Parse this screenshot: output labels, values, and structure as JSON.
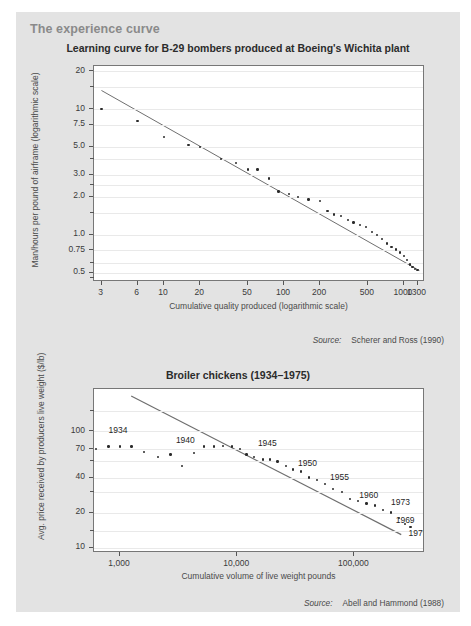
{
  "panel": {
    "title": "The experience curve",
    "background": "#e3e3e3",
    "title_color": "#8a8a8a"
  },
  "charts": [
    {
      "id": "learning-curve-b29",
      "title": "Learning curve for B-29 bombers produced at Boeing's Wichita plant",
      "xlabel": "Cumulative quality produced (logarithmic scale)",
      "ylabel": "Man/hours per pound of airframe (logarithmic scale)",
      "source_word": "Source:",
      "source_text": "Scherer and Ross (1990)",
      "ytick_labels": [
        "20",
        "10",
        "7.5",
        "5.0",
        "3.0",
        "2.0",
        "1.0",
        "0.75",
        "0.5"
      ],
      "xtick_labels": [
        "3",
        "6",
        "10",
        "20",
        "50",
        "100",
        "200",
        "500",
        "1000",
        "1300"
      ]
    },
    {
      "id": "broiler-chickens",
      "title": "Broiler chickens (1934–1975)",
      "xlabel": "Cumulative volume of live weight pounds",
      "ylabel": "Avg. price received by producers live weight ($/lb)",
      "source_word": "Source:",
      "source_text": "Abell and Hammond (1988)",
      "ytick_labels": [
        "100",
        "70",
        "40",
        "20",
        "10"
      ],
      "xtick_labels": [
        "1,000",
        "10,000",
        "100,000"
      ],
      "point_labels": [
        "1934",
        "1940",
        "1945",
        "1950",
        "1955",
        "1960",
        "1973",
        "1969",
        "1975"
      ]
    }
  ],
  "chart_data": [
    {
      "type": "scatter",
      "id": "learning-curve-b29",
      "title": "Learning curve for B-29 bombers produced at Boeing's Wichita plant",
      "xlabel": "Cumulative quality produced (logarithmic scale)",
      "ylabel": "Man/hours per pound of airframe (logarithmic scale)",
      "xscale": "log",
      "yscale": "log",
      "xlim": [
        2.6,
        1500
      ],
      "ylim": [
        0.42,
        22
      ],
      "grid": true,
      "legend": "none",
      "xticks": [
        3,
        6,
        10,
        20,
        50,
        100,
        200,
        500,
        1000,
        1300
      ],
      "yticks": [
        20,
        10,
        7.5,
        5.0,
        3.0,
        2.0,
        1.0,
        0.75,
        0.5
      ],
      "x": [
        3,
        6,
        10,
        16,
        20,
        30,
        40,
        50,
        60,
        75,
        90,
        110,
        130,
        160,
        200,
        230,
        260,
        300,
        340,
        380,
        430,
        480,
        540,
        600,
        660,
        720,
        790,
        860,
        930,
        1000,
        1060,
        1120,
        1180,
        1240,
        1300
      ],
      "y": [
        10.0,
        8.0,
        6.0,
        5.2,
        5.0,
        4.0,
        3.7,
        3.3,
        3.3,
        2.8,
        2.2,
        2.1,
        2.0,
        1.9,
        1.85,
        1.55,
        1.45,
        1.4,
        1.3,
        1.25,
        1.2,
        1.15,
        1.05,
        1.0,
        0.92,
        0.85,
        0.8,
        0.76,
        0.72,
        0.68,
        0.63,
        0.58,
        0.55,
        0.53,
        0.52
      ],
      "trendline": {
        "x": [
          3,
          1400
        ],
        "y": [
          14.0,
          0.5
        ]
      }
    },
    {
      "type": "scatter",
      "id": "broiler-chickens",
      "title": "Broiler chickens (1934–1975)",
      "xlabel": "Cumulative volume of live weight pounds",
      "ylabel": "Avg. price received by producers live weight ($/lb)",
      "xscale": "log",
      "yscale": "log",
      "xlim": [
        600,
        400000
      ],
      "ylim": [
        9,
        230
      ],
      "grid": true,
      "legend": "none",
      "xticks": [
        1000,
        10000,
        100000
      ],
      "yticks": [
        100,
        70,
        40,
        20,
        10
      ],
      "x": [
        620,
        800,
        1000,
        1250,
        1600,
        2100,
        2700,
        3400,
        4300,
        5200,
        6300,
        7600,
        9000,
        10500,
        12000,
        14000,
        16500,
        19000,
        22000,
        26000,
        30000,
        35000,
        41000,
        48000,
        56000,
        66000,
        78000,
        92000,
        108000,
        127000,
        150000,
        175000,
        205000,
        240000,
        270000,
        300000
      ],
      "y": [
        70,
        74,
        74,
        74,
        66,
        60,
        63,
        50,
        65,
        74,
        74,
        75,
        74,
        70,
        63,
        60,
        57,
        57,
        55,
        50,
        47,
        45,
        40,
        38,
        35,
        32,
        30,
        26,
        25,
        24,
        23,
        21,
        20,
        18,
        16,
        15
      ],
      "trendline": {
        "x": [
          1250,
          260000
        ],
        "y": [
          200,
          12.5
        ]
      },
      "annotations": [
        {
          "label": "1934",
          "x": 800,
          "y": 100
        },
        {
          "label": "1940",
          "x": 3000,
          "y": 82
        },
        {
          "label": "1945",
          "x": 15000,
          "y": 78
        },
        {
          "label": "1950",
          "x": 33000,
          "y": 52
        },
        {
          "label": "1955",
          "x": 62000,
          "y": 40
        },
        {
          "label": "1960",
          "x": 110000,
          "y": 28
        },
        {
          "label": "1973",
          "x": 205000,
          "y": 24
        },
        {
          "label": "1969",
          "x": 225000,
          "y": 17
        },
        {
          "label": "1975",
          "x": 290000,
          "y": 13
        }
      ]
    }
  ]
}
